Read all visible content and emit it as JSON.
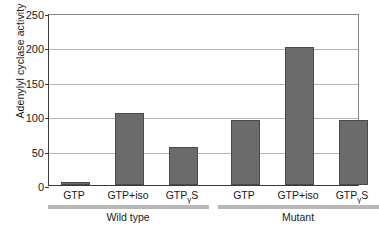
{
  "chart_data": {
    "type": "bar",
    "title": "",
    "xlabel": "",
    "ylabel": "Adenylyl cyclase activity",
    "ylim": [
      0,
      250
    ],
    "yticks": [
      0,
      50,
      100,
      150,
      200,
      250
    ],
    "ytick_labels": [
      "0",
      "50",
      "100",
      "150",
      "200",
      "250"
    ],
    "grid": "horizontal",
    "legend": "none",
    "categories": [
      "GTP",
      "GTP+iso",
      "GTPγS",
      "GTP",
      "GTP+iso",
      "GTPγS"
    ],
    "values": [
      5,
      105,
      55,
      95,
      200,
      95
    ],
    "bars": [
      {
        "label_main": "GTP",
        "label_sub": "",
        "label_tail": "",
        "value": 5,
        "group": "Wild type"
      },
      {
        "label_main": "GTP+iso",
        "label_sub": "",
        "label_tail": "",
        "value": 105,
        "group": "Wild type"
      },
      {
        "label_main": "GTP",
        "label_sub": "γ",
        "label_tail": "S",
        "value": 55,
        "group": "Wild type"
      },
      {
        "label_main": "GTP",
        "label_sub": "",
        "label_tail": "",
        "value": 95,
        "group": "Mutant"
      },
      {
        "label_main": "GTP+iso",
        "label_sub": "",
        "label_tail": "",
        "value": 200,
        "group": "Mutant"
      },
      {
        "label_main": "GTP",
        "label_sub": "γ",
        "label_tail": "S",
        "value": 95,
        "group": "Mutant"
      }
    ],
    "groups": [
      {
        "name": "Wild type",
        "bar_indices": [
          0,
          1,
          2
        ]
      },
      {
        "name": "Mutant",
        "bar_indices": [
          3,
          4,
          5
        ]
      }
    ],
    "colors": {
      "bar_fill": "#6b6b6b",
      "bar_edge": "#4a4a4a",
      "gridline": "#b5b5b5",
      "axis": "#3a3a3a",
      "group_rule": "#b8b8b8",
      "text": "#1a1a1a",
      "background": "#ffffff"
    }
  }
}
